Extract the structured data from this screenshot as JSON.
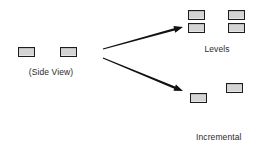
{
  "figure": {
    "type": "diagram",
    "background_color": "#ffffff",
    "block_fill_color": "#d4d4d4",
    "block_stroke_color": "#1c1c1c",
    "text_color": "#2a2a2a"
  },
  "groups": {
    "source": {
      "caption": "(Side View)",
      "caption_x": 18,
      "caption_y": 67,
      "caption_width": 66,
      "blocks": [
        {
          "x": 18,
          "y": 47,
          "w": 17,
          "h": 10
        },
        {
          "x": 60,
          "y": 47,
          "w": 17,
          "h": 10
        }
      ]
    },
    "levels": {
      "caption": "Levels",
      "caption_x": 188,
      "caption_y": 44,
      "caption_width": 58,
      "blocks": [
        {
          "x": 188,
          "y": 10,
          "w": 17,
          "h": 10
        },
        {
          "x": 228,
          "y": 10,
          "w": 17,
          "h": 10
        },
        {
          "x": 188,
          "y": 23,
          "w": 17,
          "h": 10
        },
        {
          "x": 228,
          "y": 23,
          "w": 17,
          "h": 10
        }
      ]
    },
    "incremental_elevation": {
      "caption_line1": "Incremental",
      "caption_line2": "Elevation",
      "caption_x": 196,
      "caption_y": 112,
      "caption_width": 64,
      "blocks": [
        {
          "x": 226,
          "y": 83,
          "w": 17,
          "h": 10
        },
        {
          "x": 190,
          "y": 93,
          "w": 17,
          "h": 10
        }
      ]
    }
  },
  "arrows": [
    {
      "name": "arrow-to-levels",
      "x1": 103,
      "y1": 49,
      "x2": 183,
      "y2": 27
    },
    {
      "name": "arrow-to-incremental-elevation",
      "x1": 103,
      "y1": 58,
      "x2": 183,
      "y2": 91
    }
  ]
}
